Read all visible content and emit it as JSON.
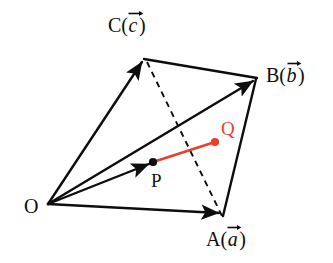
{
  "figure": {
    "kind": "vector-geometry-diagram",
    "background_color": "#ffffff",
    "line_color": "#0d0d0d",
    "accent_color": "#e8402a"
  },
  "vertices": {
    "origin": {
      "name": "O",
      "label": "O",
      "x": 48,
      "y": 204,
      "label_x": 24,
      "label_y": 213
    },
    "a": {
      "name": "A",
      "label_letter": "A",
      "label_paren_open": "(",
      "label_vector": "a",
      "label_paren_close": ")",
      "x": 222,
      "y": 214,
      "label_x": 206,
      "label_y": 246
    },
    "b": {
      "name": "B",
      "label_letter": "B",
      "label_paren_open": "(",
      "label_vector": "b",
      "label_paren_close": ")",
      "x": 256,
      "y": 78,
      "label_x": 266,
      "label_y": 82
    },
    "c": {
      "name": "C",
      "label_letter": "C",
      "label_paren_open": "(",
      "label_vector": "c",
      "label_paren_close": ")",
      "x": 144,
      "y": 59,
      "label_x": 108,
      "label_y": 32
    }
  },
  "points": {
    "p": {
      "name": "P",
      "label": "P",
      "x": 153,
      "y": 162,
      "label_x": 151,
      "label_y": 187,
      "color": "#0d0d0d"
    },
    "q": {
      "name": "Q",
      "label": "Q",
      "x": 215,
      "y": 142,
      "label_x": 221,
      "label_y": 135,
      "color": "#e8402a"
    }
  },
  "edges": [
    {
      "name": "vector-o-to-c",
      "from": "origin",
      "to": "c",
      "style": "solid",
      "arrow": true
    },
    {
      "name": "vector-o-to-b",
      "from": "origin",
      "to": "b",
      "style": "solid",
      "arrow": true
    },
    {
      "name": "vector-o-to-a",
      "from": "origin",
      "to": "a",
      "style": "solid",
      "arrow": true
    },
    {
      "name": "vector-o-to-p",
      "from": "origin",
      "to": "p",
      "style": "solid",
      "arrow": true
    },
    {
      "name": "edge-c-to-b",
      "from": "c",
      "to": "b",
      "style": "solid",
      "arrow": false
    },
    {
      "name": "edge-b-to-a",
      "from": "b",
      "to": "a",
      "style": "solid",
      "arrow": false
    },
    {
      "name": "edge-c-to-a-dashed",
      "from": "c",
      "to": "a",
      "style": "dashed",
      "arrow": false
    },
    {
      "name": "segment-p-to-q",
      "from": "p",
      "to": "q",
      "style": "solid-red",
      "arrow": false
    }
  ],
  "labels": {
    "vector_arrow_symbol": "→"
  }
}
